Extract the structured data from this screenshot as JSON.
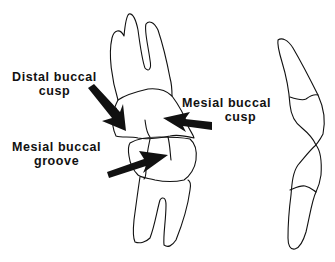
{
  "diagram": {
    "type": "dental anatomy illustration",
    "labels": [
      {
        "id": "distal-buccal-cusp",
        "line1": "Distal buccal",
        "line2": "cusp"
      },
      {
        "id": "mesial-buccal-cusp",
        "line1": "Mesial buccal",
        "line2": "cusp"
      },
      {
        "id": "mesial-buccal-groove",
        "line1": "Mesial buccal",
        "line2": "groove"
      }
    ],
    "colors": {
      "stroke": "#111111",
      "background": "#ffffff"
    }
  }
}
